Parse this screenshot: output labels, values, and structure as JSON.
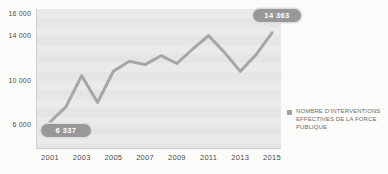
{
  "chart_data": {
    "type": "line",
    "title": "",
    "x": [
      2001,
      2002,
      2003,
      2004,
      2005,
      2006,
      2007,
      2008,
      2009,
      2010,
      2011,
      2012,
      2013,
      2014,
      2015
    ],
    "series": [
      {
        "name": "Nombre d’interventions effectives de la force publique",
        "values": [
          6337,
          7700,
          10500,
          8100,
          10900,
          11800,
          11500,
          12300,
          11600,
          12900,
          14100,
          12600,
          10900,
          12400,
          14363
        ]
      }
    ],
    "xticks": [
      "2001",
      "2003",
      "2005",
      "2007",
      "2009",
      "2011",
      "2013",
      "2015"
    ],
    "yticks": [
      {
        "value": 16000,
        "label": "16 000"
      },
      {
        "value": 14000,
        "label": "14 000"
      },
      {
        "value": 10000,
        "label": "10 000"
      },
      {
        "value": 6000,
        "label": "6 000"
      }
    ],
    "ylim": [
      4000,
      16500
    ],
    "grid": "horizontal-bands",
    "line_color": "#a6a6a4",
    "annotations": [
      {
        "x": 2001,
        "label": "6 337"
      },
      {
        "x": 2015,
        "label": "14 363"
      }
    ],
    "legend": {
      "position": "right",
      "marker_color": "#a2a2a0",
      "lines": [
        "NOMBRE D’INTERVENTIONS",
        "EFFECTIVES DE LA FORCE",
        "PUBLIQUE"
      ]
    }
  }
}
